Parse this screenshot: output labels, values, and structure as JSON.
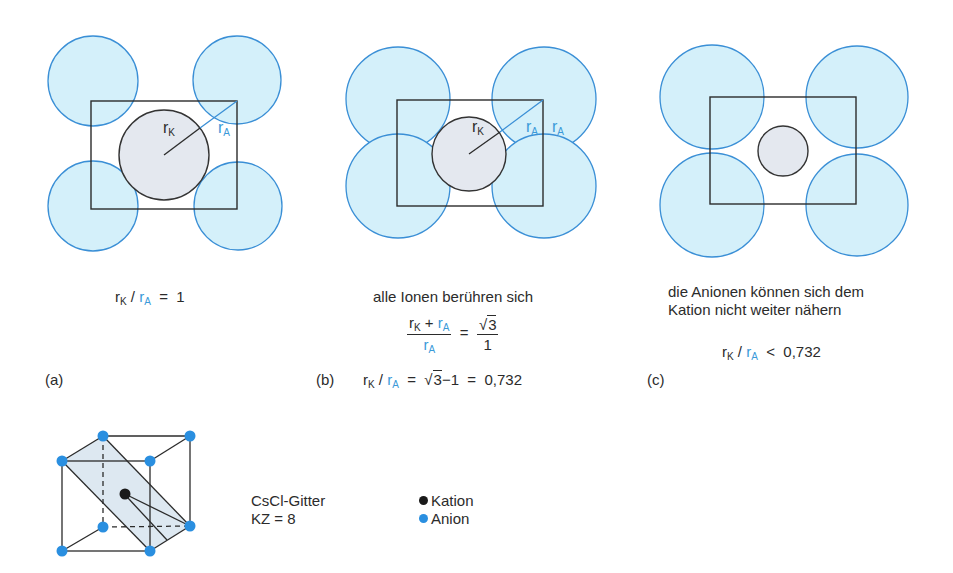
{
  "colors": {
    "anion_fill": "#d4f0fa",
    "anion_stroke": "#3a8fd6",
    "cation_fill": "#e4e8ef",
    "cation_stroke": "#333333",
    "accent_blue_text": "#3a9ad9",
    "line": "#2b2b2b"
  },
  "symbols": {
    "r": "r",
    "K": "K",
    "A": "A",
    "slash": "/",
    "equals": "=",
    "plus": "+",
    "less": "<",
    "sqrt": "√",
    "three": "3",
    "one": "1",
    "minus": "−"
  },
  "panels": [
    {
      "id": "a",
      "label": "(a)",
      "diagram_labels": {
        "cation_radius": "rK",
        "anion_radius": "rA"
      },
      "ratio_value": "1",
      "relation": "="
    },
    {
      "id": "b",
      "label": "(b)",
      "caption": "alle Ionen berühren sich",
      "diagram_labels": {
        "cation_radius": "rK",
        "anion_radius_1": "rA",
        "anion_radius_2": "rA"
      },
      "fraction_rhs_num": "√3",
      "fraction_rhs_den": "1",
      "result_expression": "√3−1",
      "ratio_value": "0,732",
      "relation": "="
    },
    {
      "id": "c",
      "label": "(c)",
      "caption_line1": "die Anionen können sich dem",
      "caption_line2": "Kation nicht weiter nähern",
      "ratio_value": "0,732",
      "relation": "<"
    }
  ],
  "lattice": {
    "name": "CsCl-Gitter",
    "coordination": "KZ = 8",
    "legend": [
      {
        "label": "Kation",
        "color": "#1a1a1a"
      },
      {
        "label": "Anion",
        "color": "#2a8fe0"
      }
    ]
  }
}
